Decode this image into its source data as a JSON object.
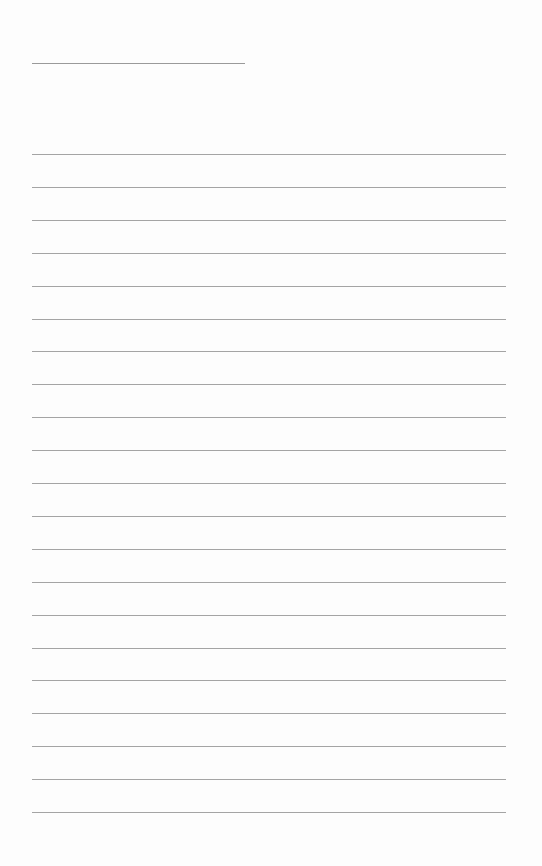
{
  "page": {
    "type": "ruled-paper",
    "title_line": {
      "left": 32,
      "top": 63,
      "width": 213
    },
    "rules": {
      "count": 21,
      "first_top": 154,
      "spacing": 32.9,
      "left": 32,
      "width": 474
    },
    "line_color": "#a4a4a4",
    "background": "#fdfdfd"
  }
}
